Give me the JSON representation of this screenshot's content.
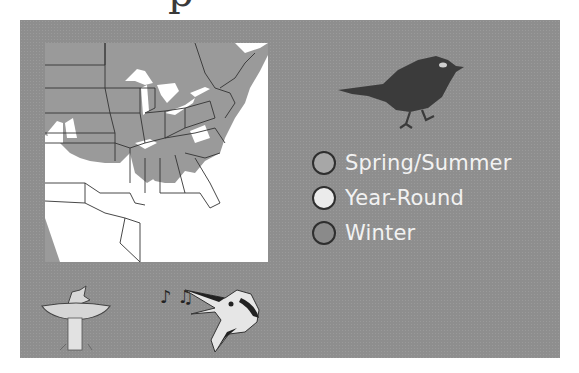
{
  "heading": {
    "visible_fragment": "p"
  },
  "map": {
    "name": "Eastern North America range map",
    "colors": {
      "range": "#9a9a9a",
      "background": "#ffffff",
      "borders": "#333333"
    }
  },
  "legend": {
    "items": [
      {
        "label": "Spring/Summer",
        "color": "#a7a7a7"
      },
      {
        "label": "Year-Round",
        "color": "#ebebeb"
      },
      {
        "label": "Winter",
        "color": "#8a8a8a"
      }
    ]
  },
  "illustrations": {
    "silhouette": "bird-silhouette",
    "bath": "bird-in-birdbath",
    "song": "singing-bird-head",
    "notes": "♪ ♫"
  },
  "colors": {
    "panel": "#8e8e8e",
    "label_text": "#f2f2f2"
  }
}
